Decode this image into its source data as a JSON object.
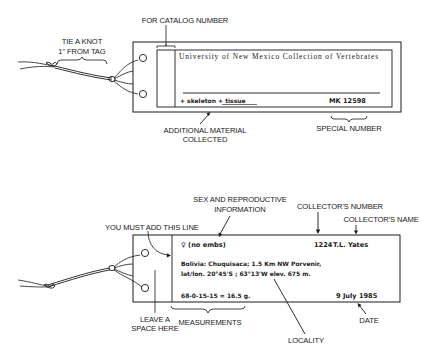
{
  "top_tag": {
    "labels": {
      "tie_knot_line1": "TIE A KNOT",
      "tie_knot_line2": "1\" FROM TAG",
      "catalog_number": "FOR CATALOG NUMBER",
      "additional_line1": "ADDITIONAL MATERIAL",
      "additional_line2": "COLLECTED",
      "special_number": "SPECIAL NUMBER"
    },
    "printed_title": "University of New Mexico Collection of Vertebrates",
    "handwritten": {
      "additional_material": "+ skeleton  + tissue",
      "special_number": "MK 12598"
    }
  },
  "bottom_tag": {
    "labels": {
      "sex_line1": "SEX AND REPRODUCTIVE",
      "sex_line2": "INFORMATION",
      "collector_number": "COLLECTOR'S NUMBER",
      "collector_name": "COLLECTOR'S NAME",
      "add_line": "YOU MUST ADD THIS LINE",
      "leave_space_line1": "LEAVE A",
      "leave_space_line2": "SPACE HERE",
      "measurements": "MEASUREMENTS",
      "locality": "LOCALITY",
      "date": "DATE"
    },
    "handwritten": {
      "sex": "♀ (no embs)",
      "collector_number": "1224",
      "collector_name": "T.L. Yates",
      "locality_line1": "Bolivia: Chuquisaca; 1.5 Km NW Porvenir,",
      "locality_line2": "lat/lon. 20°45'S ; 63°13'W elev. 675 m.",
      "measurements": "68-0-15-15 = 16.5 g.",
      "date": "9 July 1985"
    }
  }
}
